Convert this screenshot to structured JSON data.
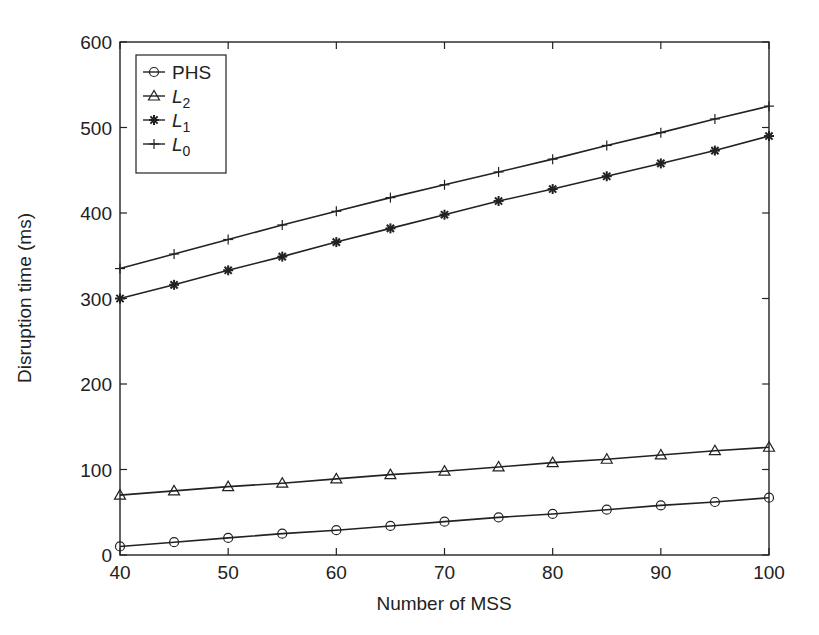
{
  "chart_data": {
    "type": "line",
    "title": "",
    "xlabel": "Number of MSS",
    "ylabel": "Disruption time (ms)",
    "xlim": [
      40,
      100
    ],
    "ylim": [
      0,
      600
    ],
    "xticks": [
      40,
      50,
      60,
      70,
      80,
      90,
      100
    ],
    "yticks": [
      0,
      100,
      200,
      300,
      400,
      500,
      600
    ],
    "grid": false,
    "legend_position": "upper left",
    "x": [
      40,
      45,
      50,
      55,
      60,
      65,
      70,
      75,
      80,
      85,
      90,
      95,
      100
    ],
    "series": [
      {
        "name": "PHS",
        "label_main": "PHS",
        "label_sub": "",
        "marker": "circle",
        "values": [
          10,
          15,
          20,
          25,
          29,
          34,
          39,
          44,
          48,
          53,
          58,
          62,
          67
        ]
      },
      {
        "name": "L2",
        "label_main": "L",
        "label_sub": "2",
        "marker": "triangle",
        "values": [
          70,
          75,
          80,
          84,
          89,
          94,
          98,
          103,
          108,
          112,
          117,
          122,
          126
        ]
      },
      {
        "name": "L1",
        "label_main": "L",
        "label_sub": "1",
        "marker": "star",
        "values": [
          300,
          316,
          333,
          349,
          366,
          382,
          398,
          414,
          428,
          443,
          458,
          473,
          490
        ]
      },
      {
        "name": "L0",
        "label_main": "L",
        "label_sub": "0",
        "marker": "plus",
        "values": [
          335,
          352,
          369,
          386,
          402,
          418,
          433,
          448,
          463,
          479,
          494,
          510,
          525
        ]
      }
    ]
  }
}
